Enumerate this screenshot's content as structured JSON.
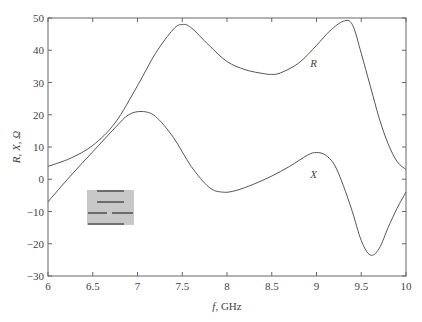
{
  "chart_data": {
    "type": "line",
    "title": "",
    "xlabel_italic": "f",
    "xlabel_rest": ", GHz",
    "ylabel": "R, X, Ω",
    "xlim": [
      6,
      10
    ],
    "ylim": [
      -30,
      50
    ],
    "xticks": [
      "6",
      "6.5",
      "7",
      "7.5",
      "8",
      "8.5",
      "9",
      "9.5",
      "10"
    ],
    "xtick_values": [
      6,
      6.5,
      7,
      7.5,
      8,
      8.5,
      9,
      9.5,
      10
    ],
    "yticks": [
      "50",
      "40",
      "30",
      "20",
      "10",
      "0",
      "−10",
      "−20",
      "−30"
    ],
    "ytick_values": [
      50,
      40,
      30,
      20,
      10,
      0,
      -10,
      -20,
      -30
    ],
    "grid": false,
    "legend": "none (inline curve labels)",
    "series": [
      {
        "name": "R",
        "label_pos": [
          8.75,
          36
        ],
        "x": [
          6.0,
          6.25,
          6.5,
          6.75,
          7.0,
          7.2,
          7.4,
          7.5,
          7.6,
          7.8,
          8.0,
          8.2,
          8.4,
          8.5,
          8.6,
          8.8,
          9.0,
          9.15,
          9.3,
          9.4,
          9.5,
          9.6,
          9.7,
          9.8,
          9.9,
          10.0
        ],
        "values": [
          4,
          6.5,
          10.5,
          17.5,
          29,
          39,
          46.5,
          48,
          47,
          41.5,
          36.5,
          34,
          32.8,
          32.5,
          33,
          36,
          41.5,
          46,
          49,
          48,
          39,
          29,
          19,
          11,
          5.5,
          3
        ]
      },
      {
        "name": "X",
        "label_pos": [
          8.75,
          1.5
        ],
        "x": [
          6.0,
          6.25,
          6.5,
          6.75,
          6.9,
          7.05,
          7.2,
          7.4,
          7.6,
          7.8,
          7.95,
          8.1,
          8.3,
          8.5,
          8.7,
          8.9,
          9.0,
          9.1,
          9.2,
          9.3,
          9.4,
          9.5,
          9.6,
          9.7,
          9.8,
          9.9,
          10.0
        ],
        "values": [
          -7,
          1,
          8.5,
          16,
          20,
          21,
          19.5,
          13,
          4,
          -2.5,
          -4,
          -3.5,
          -1.5,
          1,
          4,
          7.5,
          8.3,
          7.5,
          4.5,
          -2,
          -10,
          -19,
          -23.5,
          -21.5,
          -15,
          -9,
          -4
        ]
      }
    ],
    "annotations": [
      "R",
      "X"
    ],
    "inset": "gray rectangle with four horizontal dark bars (stripline/resonator diagram)"
  }
}
